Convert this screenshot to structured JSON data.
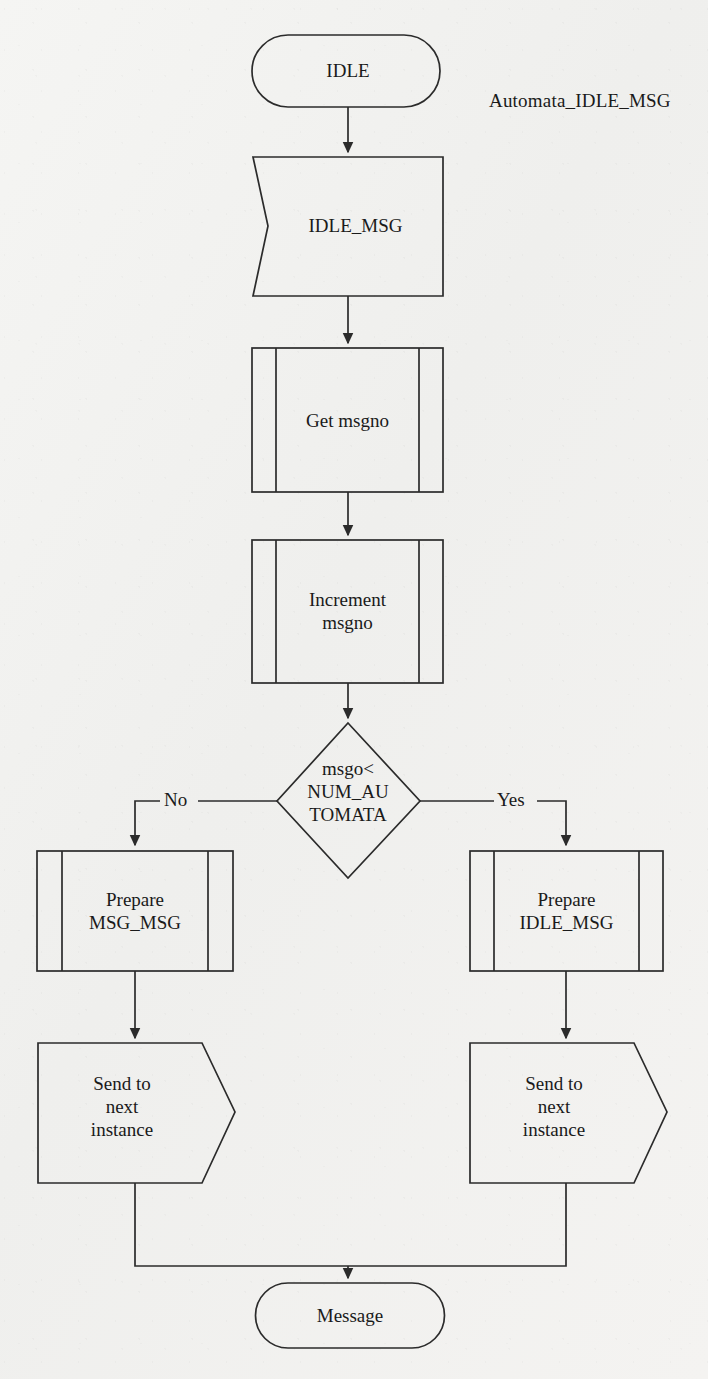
{
  "diagram": {
    "title": "Automata_IDLE_MSG",
    "type": "flowchart",
    "stroke_color": "#2b2b2b",
    "fill_color": "none",
    "background_color": "#f3f3f1",
    "nodes": [
      {
        "id": "idle",
        "shape": "terminal",
        "label": "IDLE"
      },
      {
        "id": "idle_msg",
        "shape": "message-in",
        "label": "IDLE_MSG"
      },
      {
        "id": "get_msgno",
        "shape": "predefined-process",
        "label": "Get msgno"
      },
      {
        "id": "inc_msgno",
        "shape": "predefined-process",
        "label": "Increment\nmsgno"
      },
      {
        "id": "decision",
        "shape": "decision",
        "label": "msgo<\nNUM_AU\nTOMATA"
      },
      {
        "id": "prep_msg",
        "shape": "predefined-process",
        "label": "Prepare\nMSG_MSG"
      },
      {
        "id": "prep_idle",
        "shape": "predefined-process",
        "label": "Prepare\nIDLE_MSG"
      },
      {
        "id": "send_left",
        "shape": "send",
        "label": "Send to\nnext\ninstance"
      },
      {
        "id": "send_right",
        "shape": "send",
        "label": "Send to\nnext\ninstance"
      },
      {
        "id": "message",
        "shape": "terminal",
        "label": "Message"
      }
    ],
    "edges": [
      {
        "from": "idle",
        "to": "idle_msg",
        "label": ""
      },
      {
        "from": "idle_msg",
        "to": "get_msgno",
        "label": ""
      },
      {
        "from": "get_msgno",
        "to": "inc_msgno",
        "label": ""
      },
      {
        "from": "inc_msgno",
        "to": "decision",
        "label": ""
      },
      {
        "from": "decision",
        "to": "prep_msg",
        "label": "No"
      },
      {
        "from": "decision",
        "to": "prep_idle",
        "label": "Yes"
      },
      {
        "from": "prep_msg",
        "to": "send_left",
        "label": ""
      },
      {
        "from": "prep_idle",
        "to": "send_right",
        "label": ""
      },
      {
        "from": "send_left",
        "to": "message",
        "label": ""
      },
      {
        "from": "send_right",
        "to": "message",
        "label": ""
      }
    ],
    "edge_labels": {
      "no": "No",
      "yes": "Yes"
    }
  }
}
